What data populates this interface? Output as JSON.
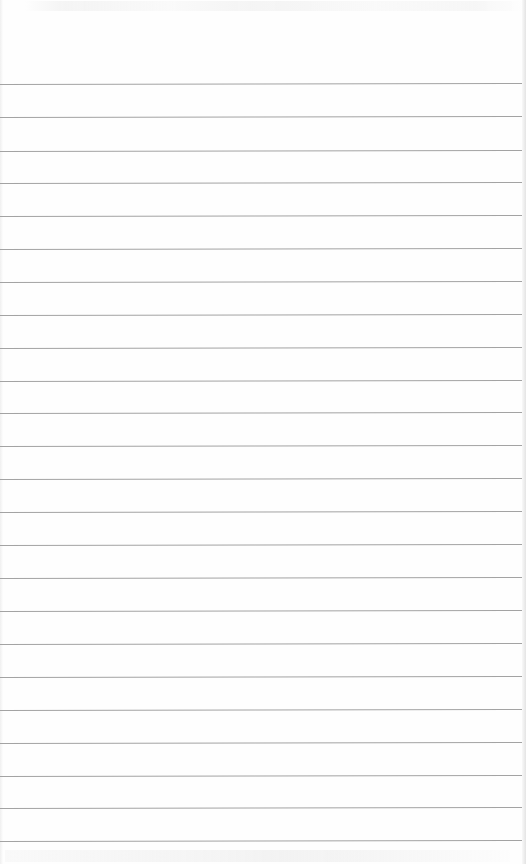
{
  "page": {
    "type": "lined-notepad-sheet",
    "background_color": "#fefefe",
    "rule_color": "#a3a3a3",
    "rule_count": 24,
    "rule_spacing_px": 32.8,
    "rules_y": [
      84,
      117,
      151,
      183,
      216,
      249,
      282,
      315,
      348,
      381,
      413,
      446,
      479,
      512,
      545,
      578,
      611,
      644,
      677,
      710,
      743,
      776,
      808,
      841
    ],
    "text_content": ""
  }
}
